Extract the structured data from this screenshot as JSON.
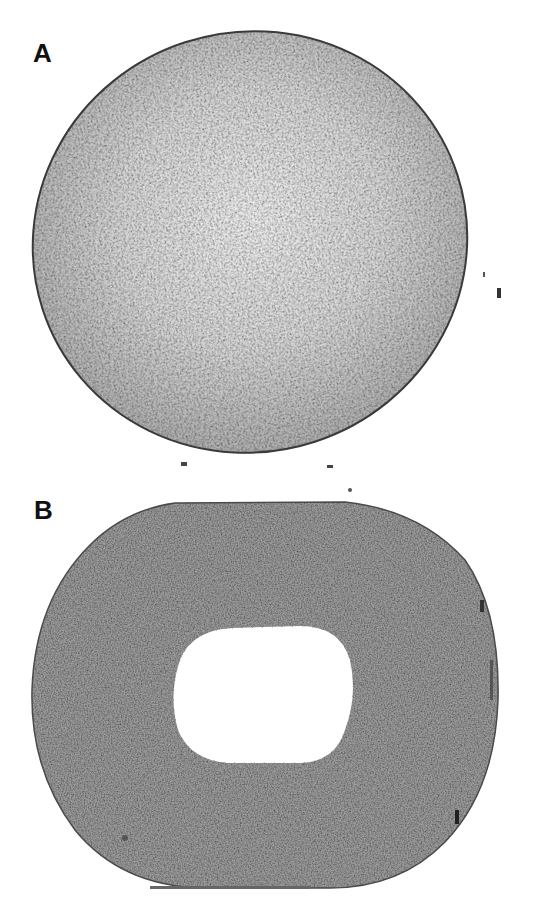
{
  "figure": {
    "panels": [
      {
        "id": "A",
        "label": "A",
        "description": "Elliptical disc, speckled light-gray texture, lighter at center, dark thin rim",
        "fill_center": "#e6e6e6",
        "fill_edge": "#a9a9a9",
        "rim_color": "#3a3a3a"
      },
      {
        "id": "B",
        "label": "B",
        "description": "Rounded disc with flattened top, uniform medium-gray speckled texture, central white rounded-rectangle hole",
        "fill": "#9a9a9a",
        "rim_color": "#444444",
        "hole_color": "#ffffff"
      }
    ],
    "background": "#ffffff"
  }
}
